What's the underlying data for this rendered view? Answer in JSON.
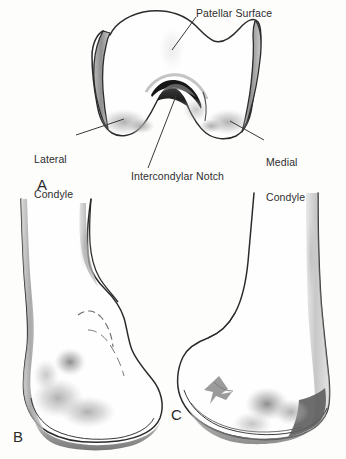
{
  "figure": {
    "background_color": "#fdfdfc",
    "ink_color": "#2b2b2b",
    "shade_color": "#9d9d9d",
    "dark_shade_color": "#2a2a2a",
    "width": 346,
    "height": 459
  },
  "panels": [
    {
      "letter": "A",
      "name": "distal-view",
      "description": "Distal (inferior) view of the right femur showing the articular surfaces"
    },
    {
      "letter": "B",
      "name": "lateral-view",
      "description": "Lateral view of the distal femur"
    },
    {
      "letter": "C",
      "name": "anterior-view",
      "description": "Anterior view of the distal femur"
    }
  ],
  "labels": {
    "patellar_surface": "Patellar Surface",
    "lateral_condyle_line1": "Lateral",
    "lateral_condyle_line2": "Condyle",
    "medial_condyle_line1": "Medial",
    "medial_condyle_line2": "Condyle",
    "intercondylar_notch": "Intercondylar Notch"
  }
}
